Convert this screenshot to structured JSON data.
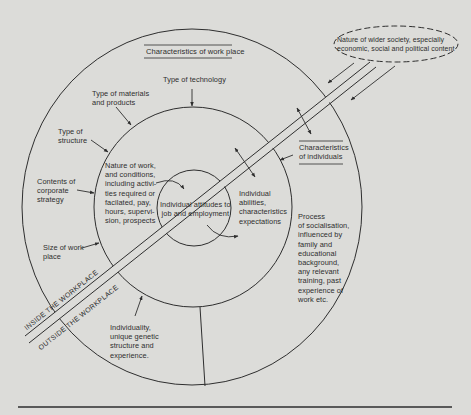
{
  "diagram": {
    "colors": {
      "background": "#dcdcd9",
      "line": "#2e2e2e",
      "text": "#2e2e2e"
    },
    "section_headings": {
      "work_place": "Characteristics of work place",
      "individuals": "Characteristics\nof individuals"
    },
    "outer_ring_labels": {
      "type_of_technology": "Type of technology",
      "type_of_materials": "Type of materials\nand products",
      "type_of_structure": "Type of\nstructure",
      "contents_of_strategy": "Contents of\ncorporate\nstrategy",
      "size_of_work_place": "Size of work\nplace",
      "individuality": "Individuality,\nunique genetic\nstructure and\nexperience.",
      "socialisation": "Process\nof socialisation,\ninfluenced by\nfamily and\neducational\nbackground,\nany relevant\ntraining, past\nexperience of\nwork etc."
    },
    "middle_ring_labels": {
      "nature_of_work": "Nature of work,\nand conditions,\nincluding activi-\nties required or\nfacilated, pay,\nhours, supervi-\nsion, prospects",
      "individual_abilities": "Individual\nabilities,\ncharacteristics\nexpectations"
    },
    "center_label": "Individual attitudes to\njob and employment",
    "wider_society": "Nature of wider society, especially\neconomic, social and political content",
    "band_labels": {
      "inside": "INSIDE THE WORKPLACE",
      "outside": "OUTSIDE THE WORKPLACE"
    }
  }
}
